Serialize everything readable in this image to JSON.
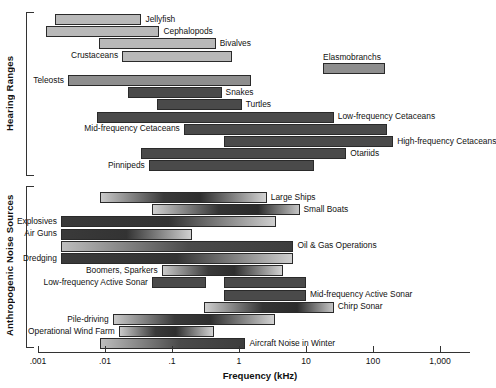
{
  "chart_data": {
    "type": "bar",
    "title": "",
    "xlabel": "Frequency (kHz)",
    "ylabel": "",
    "scale": "log",
    "xlim": [
      0.001,
      1000
    ],
    "ticks": [
      {
        "value": 0.001,
        "label": ".001"
      },
      {
        "value": 0.01,
        "label": ".01"
      },
      {
        "value": 0.1,
        "label": ".1"
      },
      {
        "value": 1,
        "label": "1"
      },
      {
        "value": 10,
        "label": "10"
      },
      {
        "value": 100,
        "label": "100"
      },
      {
        "value": 1000,
        "label": "1,000"
      }
    ],
    "grid": false,
    "legend": "none",
    "sections": [
      {
        "name": "Hearing Ranges",
        "bars": [
          {
            "label": "Jellyfish",
            "min": 0.0018,
            "max": 0.035,
            "shade": "light",
            "label_side": "right"
          },
          {
            "label": "Cephalopods",
            "min": 0.0013,
            "max": 0.065,
            "shade": "light",
            "label_side": "right"
          },
          {
            "label": "Bivalves",
            "min": 0.008,
            "max": 0.45,
            "shade": "light",
            "label_side": "right"
          },
          {
            "label": "Crustaceans",
            "min": 0.018,
            "max": 0.8,
            "shade": "light",
            "label_side": "left"
          },
          {
            "label": "Elasmobranchs",
            "min": 18,
            "max": 150,
            "shade": "mid",
            "label_side": "above"
          },
          {
            "label": "Teleosts",
            "min": 0.0028,
            "max": 1.5,
            "shade": "mid",
            "label_side": "left"
          },
          {
            "label": "Snakes",
            "min": 0.022,
            "max": 0.55,
            "shade": "dark",
            "label_side": "right"
          },
          {
            "label": "Turtles",
            "min": 0.06,
            "max": 1.1,
            "shade": "dark",
            "label_side": "right"
          },
          {
            "label": "Low-frequency Cetaceans",
            "min": 0.0075,
            "max": 26,
            "shade": "dark",
            "label_side": "right"
          },
          {
            "label": "Mid-frequency Cetaceans",
            "min": 0.15,
            "max": 160,
            "shade": "dark",
            "label_side": "left"
          },
          {
            "label": "High-frequency Cetaceans",
            "min": 0.6,
            "max": 200,
            "shade": "dark",
            "label_side": "right"
          },
          {
            "label": "Otariids",
            "min": 0.035,
            "max": 40,
            "shade": "dark",
            "label_side": "right"
          },
          {
            "label": "Pinnipeds",
            "min": 0.045,
            "max": 13,
            "shade": "dark",
            "label_side": "left"
          }
        ]
      },
      {
        "name": "Anthropogenic Noise Sources",
        "bars": [
          {
            "label": "Large Ships",
            "min": 0.0085,
            "max": 2.6,
            "shade": "grad",
            "label_side": "right"
          },
          {
            "label": "Small Boats",
            "min": 0.05,
            "max": 8,
            "shade": "grad-rev",
            "label_side": "right"
          },
          {
            "label": "Explosives",
            "min": 0.0022,
            "max": 3.6,
            "shade": "grad-left",
            "label_side": "left"
          },
          {
            "label": "Air Guns",
            "min": 0.0022,
            "max": 0.2,
            "shade": "grad-left",
            "label_side": "left"
          },
          {
            "label": "Oil & Gas Operations",
            "min": 0.0022,
            "max": 6.5,
            "shade": "grad-flat",
            "label_side": "right"
          },
          {
            "label": "Dredging",
            "min": 0.0022,
            "max": 6.5,
            "shade": "grad-left",
            "label_side": "left"
          },
          {
            "label": "Boomers, Sparkers",
            "min": 0.07,
            "max": 4.5,
            "shade": "grad",
            "label_side": "left"
          },
          {
            "label": "Low-frequency Active Sonar",
            "min": 0.05,
            "max": 0.32,
            "shade": "dark",
            "label_side": "left"
          },
          {
            "label": "Mid-frequency Active Sonar",
            "min": 0.6,
            "max": 10,
            "shade": "dark",
            "label_side": "right"
          },
          {
            "label": "Chirp Sonar",
            "min": 0.3,
            "max": 26,
            "shade": "grad-rev",
            "label_side": "right"
          },
          {
            "label": "Pile-driving",
            "min": 0.013,
            "max": 3.4,
            "shade": "grad",
            "label_side": "left"
          },
          {
            "label": "Operational Wind Farm",
            "min": 0.016,
            "max": 0.42,
            "shade": "grad",
            "label_side": "left"
          },
          {
            "label": "Aircraft Noise in Winter",
            "min": 0.0085,
            "max": 1.25,
            "shade": "grad-flat",
            "label_side": "right"
          }
        ]
      }
    ]
  },
  "axis": {
    "title": "Frequency (kHz)"
  },
  "sections_labels": {
    "hearing": "Hearing Ranges",
    "noise": "Anthropogenic Noise Sources"
  }
}
